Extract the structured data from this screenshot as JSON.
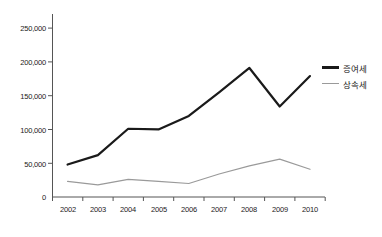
{
  "chart_data": {
    "type": "line",
    "title": "",
    "xlabel": "",
    "ylabel": "",
    "categories": [
      "2002",
      "2003",
      "2004",
      "2005",
      "2006",
      "2007",
      "2008",
      "2009",
      "2010"
    ],
    "series": [
      {
        "name": "증여세",
        "color": "#1a1a1a",
        "values": [
          48000,
          62000,
          101000,
          100000,
          120000,
          155000,
          191000,
          134000,
          179000
        ]
      },
      {
        "name": "상속세",
        "color": "#9a9a9a",
        "values": [
          23000,
          18000,
          26000,
          23000,
          20000,
          34000,
          46000,
          56000,
          41000
        ]
      }
    ],
    "ylim": [
      0,
      260000
    ],
    "yticks": [
      0,
      50000,
      100000,
      150000,
      200000,
      250000
    ],
    "ytick_labels": [
      "0",
      "50,000",
      "100,000",
      "150,000",
      "200,000",
      "250,000"
    ],
    "grid": false,
    "legend_position": "right"
  },
  "legend": {
    "entries": [
      {
        "label": "증여세"
      },
      {
        "label": "상속세"
      }
    ]
  },
  "axes": {
    "y_tick_labels": [
      "250,000",
      "200,000",
      "150,000",
      "100,000",
      "50,000",
      "0"
    ],
    "x_tick_labels": [
      "2002",
      "2003",
      "2004",
      "2005",
      "2006",
      "2007",
      "2008",
      "2009",
      "2010"
    ]
  }
}
